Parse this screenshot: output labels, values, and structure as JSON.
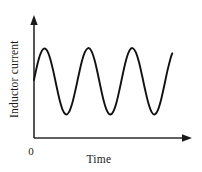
{
  "figure": {
    "background_color": "#ffffff",
    "line_color": "#111111",
    "axis_color": "#2b2b2b",
    "text_color": "#1a1a1a",
    "origin_label": "0",
    "x_axis_label": "Time",
    "y_axis_label": "Inductor current"
  },
  "chart_data": {
    "type": "line",
    "title": "",
    "xlabel": "Time",
    "ylabel": "Inductor current",
    "origin_label": "0",
    "grid": false,
    "legend": null,
    "axis_arrows": {
      "x": true,
      "y": true
    },
    "xlim": [
      0,
      1
    ],
    "ylim": [
      0,
      1
    ],
    "x_ticks": [],
    "y_ticks": [],
    "waveform": {
      "shape": "sine",
      "cycles": 4.75,
      "amplitude_constant": true,
      "phase_start": "zero-crossing-rising",
      "peaks_count": 5,
      "troughs_count": 4,
      "baseline_y": 0.5,
      "peak_y": 0.77,
      "trough_y": 0.23,
      "x_start": 0.0,
      "x_end": 0.87
    },
    "series": [
      {
        "name": "Inductor current",
        "x": [
          0.0,
          0.02,
          0.04,
          0.06,
          0.08,
          0.1,
          0.12,
          0.14,
          0.16,
          0.18,
          0.2,
          0.22,
          0.24,
          0.26,
          0.28,
          0.3,
          0.32,
          0.34,
          0.36,
          0.38,
          0.4,
          0.42,
          0.44,
          0.46,
          0.48,
          0.5,
          0.52,
          0.54,
          0.56,
          0.58,
          0.6,
          0.62,
          0.64,
          0.66,
          0.68,
          0.7,
          0.72,
          0.74,
          0.76,
          0.78,
          0.8,
          0.82,
          0.84,
          0.86,
          0.87
        ],
        "y": [
          0.5,
          0.627,
          0.723,
          0.769,
          0.758,
          0.692,
          0.585,
          0.457,
          0.334,
          0.243,
          0.204,
          0.223,
          0.297,
          0.409,
          0.536,
          0.655,
          0.74,
          0.775,
          0.753,
          0.676,
          0.561,
          0.431,
          0.313,
          0.232,
          0.202,
          0.231,
          0.313,
          0.431,
          0.561,
          0.676,
          0.753,
          0.775,
          0.74,
          0.655,
          0.536,
          0.409,
          0.297,
          0.223,
          0.204,
          0.243,
          0.334,
          0.457,
          0.585,
          0.692,
          0.73
        ]
      }
    ]
  }
}
